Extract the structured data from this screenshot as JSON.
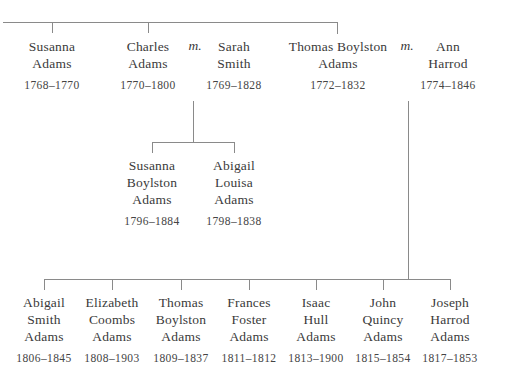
{
  "marriage_symbol": "m.",
  "generation1": [
    {
      "name_lines": [
        "Susanna",
        "Adams"
      ],
      "dates": "1768–1770"
    },
    {
      "name_lines": [
        "Charles",
        "Adams"
      ],
      "dates": "1770–1800"
    },
    {
      "name_lines": [
        "Sarah",
        "Smith"
      ],
      "dates": "1769–1828"
    },
    {
      "name_lines": [
        "Thomas Boylston",
        "Adams"
      ],
      "dates": "1772–1832"
    },
    {
      "name_lines": [
        "Ann",
        "Harrod"
      ],
      "dates": "1774–1846"
    }
  ],
  "generation2_charles": [
    {
      "name_lines": [
        "Susanna",
        "Boylston",
        "Adams"
      ],
      "dates": "1796–1884"
    },
    {
      "name_lines": [
        "Abigail",
        "Louisa",
        "Adams"
      ],
      "dates": "1798–1838"
    }
  ],
  "generation2_thomas": [
    {
      "name_lines": [
        "Abigail",
        "Smith",
        "Adams"
      ],
      "dates": "1806–1845"
    },
    {
      "name_lines": [
        "Elizabeth",
        "Coombs",
        "Adams"
      ],
      "dates": "1808–1903"
    },
    {
      "name_lines": [
        "Thomas",
        "Boylston",
        "Adams"
      ],
      "dates": "1809–1837"
    },
    {
      "name_lines": [
        "Frances",
        "Foster",
        "Adams"
      ],
      "dates": "1811–1812"
    },
    {
      "name_lines": [
        "Isaac",
        "Hull",
        "Adams"
      ],
      "dates": "1813–1900"
    },
    {
      "name_lines": [
        "John",
        "Quincy",
        "Adams"
      ],
      "dates": "1815–1854"
    },
    {
      "name_lines": [
        "Joseph",
        "Harrod",
        "Adams"
      ],
      "dates": "1817–1853"
    }
  ]
}
